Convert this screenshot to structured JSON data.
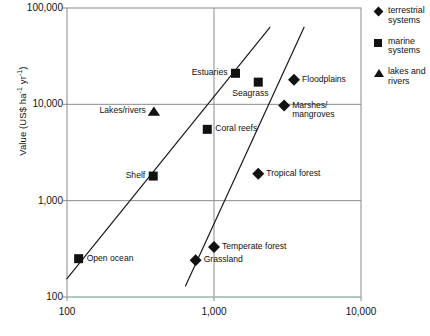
{
  "chart_data": {
    "type": "scatter",
    "title": "",
    "xlabel": "",
    "ylabel": "Value (US$ ha-1 yr-1)",
    "ylabel_parts": {
      "base": "Value (US$ ha",
      "sup1": "-1",
      "mid": " yr",
      "sup2": "-1",
      "end": ")"
    },
    "xscale": "log",
    "yscale": "log",
    "xlim": [
      100,
      10000
    ],
    "ylim": [
      100,
      100000
    ],
    "grid": true,
    "xticks": [
      "100",
      "1,000",
      "10,000"
    ],
    "xtick_values": [
      100,
      1000,
      10000
    ],
    "yticks": [
      "100,000",
      "10,000",
      "1,000",
      "100"
    ],
    "ytick_values": [
      100000,
      10000,
      1000,
      100
    ],
    "legend_position": "right",
    "legend": [
      {
        "marker": "diamond",
        "label_line1": "terrestrial",
        "label_line2": "systems"
      },
      {
        "marker": "square",
        "label_line1": "marine",
        "label_line2": "systems"
      },
      {
        "marker": "triangle",
        "label_line1": "lakes and",
        "label_line2": "rivers"
      }
    ],
    "points": [
      {
        "name": "Open ocean",
        "x": 120,
        "y": 250,
        "marker": "square",
        "label": "Open ocean",
        "label_pos": "right"
      },
      {
        "name": "Shelf",
        "x": 386,
        "y": 1800,
        "marker": "square",
        "label": "Shelf",
        "label_pos": "left"
      },
      {
        "name": "Lakes/rivers",
        "x": 390,
        "y": 8500,
        "marker": "triangle",
        "label": "Lakes/rivers",
        "label_pos": "left"
      },
      {
        "name": "Coral reefs",
        "x": 900,
        "y": 5500,
        "marker": "square",
        "label": "Coral reefs",
        "label_pos": "right"
      },
      {
        "name": "Estuaries",
        "x": 1400,
        "y": 21000,
        "marker": "square",
        "label": "Estuaries",
        "label_pos": "left"
      },
      {
        "name": "Seagrass",
        "x": 2000,
        "y": 17000,
        "marker": "square",
        "label": "Seagrass",
        "label_pos": "below"
      },
      {
        "name": "Marshes/mangroves",
        "x": 3000,
        "y": 9700,
        "marker": "diamond",
        "label": "Marshes/",
        "label2": "mangroves",
        "label_pos": "right"
      },
      {
        "name": "Floodplains",
        "x": 3500,
        "y": 18000,
        "marker": "diamond",
        "label": "Floodplains",
        "label_pos": "right"
      },
      {
        "name": "Tropical forest",
        "x": 2000,
        "y": 1900,
        "marker": "diamond",
        "label": "Tropical forest",
        "label_pos": "right"
      },
      {
        "name": "Temperate forest",
        "x": 1000,
        "y": 330,
        "marker": "diamond",
        "label": "Temperate forest",
        "label_pos": "right"
      },
      {
        "name": "Grassland",
        "x": 750,
        "y": 240,
        "marker": "diamond",
        "label": "Grassland",
        "label_pos": "right"
      }
    ],
    "trend_lines": [
      {
        "name": "marine-trend",
        "x1": 100,
        "y1": 155,
        "x2": 2400,
        "y2": 63000
      },
      {
        "name": "terrestrial-trend",
        "x1": 640,
        "y1": 130,
        "x2": 4100,
        "y2": 63000
      }
    ]
  }
}
